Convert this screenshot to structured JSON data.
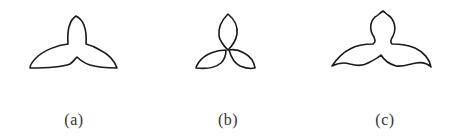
{
  "figure": {
    "panels": [
      {
        "id": "a",
        "label": "(a)",
        "description": "three-lobed shape with smooth wide wings"
      },
      {
        "id": "b",
        "label": "(b)",
        "description": "three separate overlapping petals"
      },
      {
        "id": "c",
        "label": "(c)",
        "description": "three-lobed shape with wavy wings"
      }
    ],
    "stroke_color": "#1a1a1a",
    "label_color": "#333333"
  }
}
